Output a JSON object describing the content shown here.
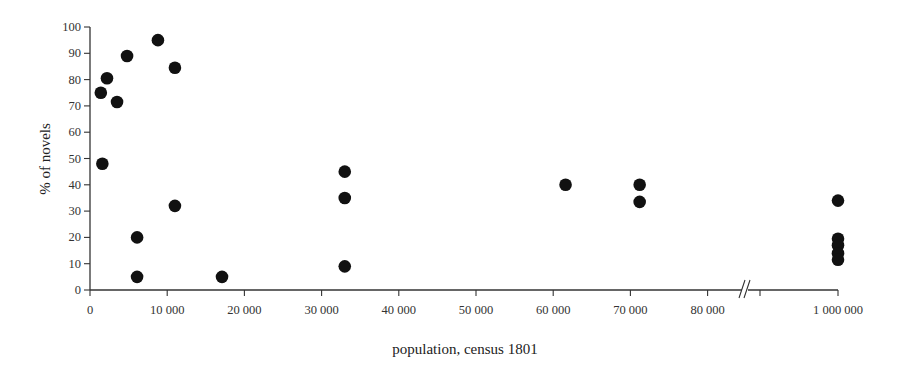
{
  "chart_data": {
    "type": "scatter",
    "title": "",
    "xlabel": "population, census 1801",
    "ylabel": "% of novels",
    "ylim": [
      0,
      100
    ],
    "xlim": [
      0,
      85000
    ],
    "x_axis_break": {
      "after": 85000,
      "jump_to": 1000000,
      "symbol": "//"
    },
    "grid": false,
    "legend": null,
    "xticks": [
      {
        "value": 0,
        "label": "0"
      },
      {
        "value": 10000,
        "label": "10 000"
      },
      {
        "value": 20000,
        "label": "20 000"
      },
      {
        "value": 30000,
        "label": "30 000"
      },
      {
        "value": 40000,
        "label": "40 000"
      },
      {
        "value": 50000,
        "label": "50 000"
      },
      {
        "value": 60000,
        "label": "60 000"
      },
      {
        "value": 70000,
        "label": "70 000"
      },
      {
        "value": 80000,
        "label": "80 000"
      },
      {
        "value": 1000000,
        "label": "1 000 000"
      }
    ],
    "yticks": [
      {
        "value": 0,
        "label": "0"
      },
      {
        "value": 10,
        "label": "10"
      },
      {
        "value": 20,
        "label": "20"
      },
      {
        "value": 30,
        "label": "30"
      },
      {
        "value": 40,
        "label": "40"
      },
      {
        "value": 50,
        "label": "50"
      },
      {
        "value": 60,
        "label": "60"
      },
      {
        "value": 70,
        "label": "70"
      },
      {
        "value": 80,
        "label": "80"
      },
      {
        "value": 90,
        "label": "90"
      },
      {
        "value": 100,
        "label": "100"
      }
    ],
    "series": [
      {
        "name": "towns",
        "marker": "filled-circle",
        "color": "#111111",
        "points": [
          {
            "x": 1400,
            "y": 75
          },
          {
            "x": 2200,
            "y": 80.5
          },
          {
            "x": 3500,
            "y": 71.5
          },
          {
            "x": 4800,
            "y": 89
          },
          {
            "x": 8800,
            "y": 95
          },
          {
            "x": 11000,
            "y": 84.5
          },
          {
            "x": 1600,
            "y": 48
          },
          {
            "x": 6100,
            "y": 20
          },
          {
            "x": 6100,
            "y": 5
          },
          {
            "x": 11000,
            "y": 32
          },
          {
            "x": 17100,
            "y": 5
          },
          {
            "x": 33000,
            "y": 45
          },
          {
            "x": 33000,
            "y": 35
          },
          {
            "x": 33000,
            "y": 9
          },
          {
            "x": 61600,
            "y": 40
          },
          {
            "x": 71200,
            "y": 40
          },
          {
            "x": 71200,
            "y": 33.5
          },
          {
            "x": 1000000,
            "y": 34
          },
          {
            "x": 1000000,
            "y": 19.5
          },
          {
            "x": 1000000,
            "y": 17
          },
          {
            "x": 1000000,
            "y": 14
          },
          {
            "x": 1000000,
            "y": 11.5
          }
        ]
      }
    ]
  }
}
